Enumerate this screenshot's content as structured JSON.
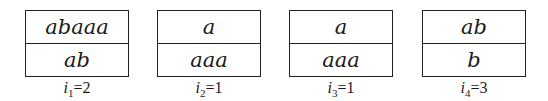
{
  "dominoes": [
    {
      "top": "abaaa",
      "bottom": "ab",
      "index_var": "i",
      "subscript": "1",
      "value": "=2"
    },
    {
      "top": "a",
      "bottom": "aaa",
      "index_var": "i",
      "subscript": "2",
      "value": "=1"
    },
    {
      "top": "a",
      "bottom": "aaa",
      "index_var": "i",
      "subscript": "3",
      "value": "=1"
    },
    {
      "top": "ab",
      "bottom": "b",
      "index_var": "i",
      "subscript": "4",
      "value": "=3"
    }
  ]
}
